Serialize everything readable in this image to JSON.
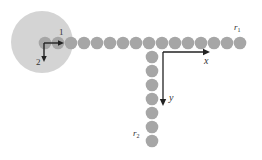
{
  "diagram": {
    "background": "#ffffff",
    "big_circle": {
      "cx": 42,
      "cy": 42,
      "r": 31,
      "color": "#d4d4d4"
    },
    "bead_color": "#a6a6a6",
    "bead_radius": 6.3,
    "row": {
      "y": 43,
      "x_start": 45,
      "spacing": 13.0,
      "count": 16
    },
    "column": {
      "x": 152,
      "y_start": 57,
      "spacing": 14.0,
      "count": 7
    },
    "local_axes": {
      "origin": [
        44,
        43
      ],
      "label_1": "1",
      "label_2": "2",
      "axis1_end": [
        64,
        43
      ],
      "axis2_end": [
        44,
        62
      ]
    },
    "global_axes": {
      "origin": [
        163,
        52
      ],
      "x_end": [
        210,
        52
      ],
      "y_end": [
        163,
        106
      ],
      "x_label": "x",
      "y_label": "y"
    },
    "labels": {
      "r1": {
        "base": "r",
        "sub": "1"
      },
      "r2": {
        "base": "r",
        "sub": "2"
      }
    }
  }
}
